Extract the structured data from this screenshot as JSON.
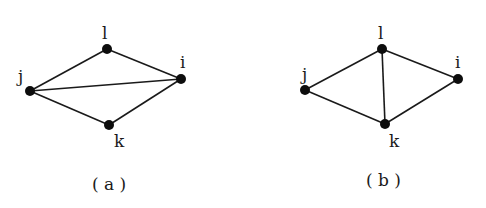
{
  "diagrams": [
    {
      "caption": "( a )",
      "nodes": {
        "l": {
          "label": "l",
          "x": 107,
          "y": 49
        },
        "j": {
          "label": "j",
          "x": 30,
          "y": 91
        },
        "i": {
          "label": "i",
          "x": 181,
          "y": 79
        },
        "k": {
          "label": "k",
          "x": 109,
          "y": 125
        }
      },
      "edges": [
        [
          "j",
          "l"
        ],
        [
          "l",
          "i"
        ],
        [
          "j",
          "i"
        ],
        [
          "j",
          "k"
        ],
        [
          "k",
          "i"
        ]
      ]
    },
    {
      "caption": "( b )",
      "nodes": {
        "l": {
          "label": "l",
          "x": 382,
          "y": 49
        },
        "j": {
          "label": "j",
          "x": 305,
          "y": 90
        },
        "i": {
          "label": "i",
          "x": 458,
          "y": 79
        },
        "k": {
          "label": "k",
          "x": 385,
          "y": 124
        }
      },
      "edges": [
        [
          "j",
          "l"
        ],
        [
          "l",
          "i"
        ],
        [
          "l",
          "k"
        ],
        [
          "j",
          "k"
        ],
        [
          "k",
          "i"
        ]
      ]
    }
  ]
}
